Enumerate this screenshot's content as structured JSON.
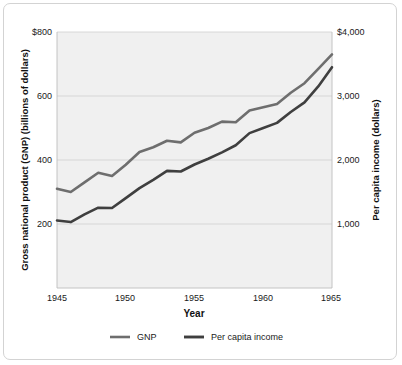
{
  "figure": {
    "background_color": "#ffffff",
    "plot_background_color": "#f0f0f0",
    "border_color": "#d3d3d3"
  },
  "chart_data": {
    "type": "line",
    "title": "",
    "subtitle": "",
    "xlabel": "Year",
    "ylabel": "Gross national product (GNP) (billions of dollars)",
    "y2label": "Per capita income (dollars)",
    "xlim": [
      1945,
      1965
    ],
    "ylim": [
      0,
      800
    ],
    "y2lim": [
      0,
      4000
    ],
    "grid": true,
    "grid_axis": "y",
    "legend_position": "bottom",
    "x_ticks": [
      1945,
      1950,
      1955,
      1960,
      1965
    ],
    "x_tick_labels": [
      "1945",
      "1950",
      "1955",
      "1960",
      "1965"
    ],
    "y_ticks": [
      200,
      400,
      600,
      800
    ],
    "y_tick_labels": [
      "200",
      "400",
      "600",
      "$800"
    ],
    "y2_ticks": [
      1000,
      2000,
      3000,
      4000
    ],
    "y2_tick_labels": [
      "1,000",
      "2,000",
      "3,000",
      "$4,000"
    ],
    "x": [
      1945,
      1946,
      1947,
      1948,
      1949,
      1950,
      1951,
      1952,
      1953,
      1954,
      1955,
      1956,
      1957,
      1958,
      1959,
      1960,
      1961,
      1962,
      1963,
      1964,
      1965
    ],
    "series": [
      {
        "name": "GNP",
        "axis": "left",
        "units": "billions of dollars",
        "color": "#6e6e6e",
        "line_width": 2.6,
        "values": [
          310,
          300,
          330,
          360,
          350,
          385,
          425,
          440,
          460,
          455,
          485,
          500,
          520,
          518,
          555,
          565,
          575,
          610,
          640,
          685,
          730
        ]
      },
      {
        "name": "Per capita income",
        "axis": "right",
        "units": "dollars",
        "color": "#3f3f3f",
        "line_width": 2.6,
        "values": [
          1055,
          1030,
          1150,
          1255,
          1250,
          1405,
          1560,
          1690,
          1830,
          1820,
          1930,
          2020,
          2120,
          2230,
          2420,
          2500,
          2580,
          2750,
          2900,
          3150,
          3450
        ]
      }
    ],
    "legend": [
      {
        "label": "GNP",
        "color": "#6e6e6e"
      },
      {
        "label": "Per capita income",
        "color": "#3f3f3f"
      }
    ]
  },
  "axes": {
    "left_title": "Gross national product (GNP) (billions of dollars)",
    "right_title": "Per capita income (dollars)",
    "x_title": "Year"
  },
  "ticks": {
    "left": [
      "$800",
      "600",
      "400",
      "200"
    ],
    "right": [
      "$4,000",
      "3,000",
      "2,000",
      "1,000"
    ],
    "bottom": [
      "1945",
      "1950",
      "1955",
      "1960",
      "1965"
    ]
  },
  "legend": {
    "gnp_label": "GNP",
    "per_capita_label": "Per capita income"
  }
}
